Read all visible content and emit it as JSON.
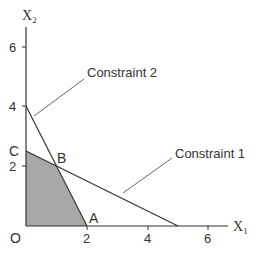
{
  "diagram": {
    "type": "linear-programming-feasible-region",
    "axes": {
      "x_label": "X",
      "x_label_sub": "1",
      "y_label": "X",
      "y_label_sub": "2",
      "origin_label": "O",
      "x_ticks": [
        "2",
        "4",
        "6"
      ],
      "y_ticks": [
        "2",
        "4",
        "6"
      ]
    },
    "constraints": [
      {
        "label": "Constraint 1",
        "from": [
          0,
          2.5
        ],
        "to": [
          5,
          0
        ]
      },
      {
        "label": "Constraint 2",
        "from": [
          0,
          4
        ],
        "to": [
          2,
          0
        ]
      }
    ],
    "points": [
      {
        "label": "A",
        "x": 2,
        "y": 0
      },
      {
        "label": "B",
        "x": 1,
        "y": 2
      },
      {
        "label": "C",
        "x": 0,
        "y": 2.5
      }
    ],
    "feasible_region": {
      "vertices": [
        [
          0,
          0
        ],
        [
          2,
          0
        ],
        [
          1,
          2
        ],
        [
          0,
          2.5
        ]
      ],
      "fill": "#a8a8a8"
    },
    "colors": {
      "line": "#333333",
      "region": "#a8a8a8"
    }
  }
}
